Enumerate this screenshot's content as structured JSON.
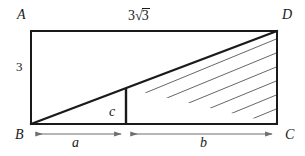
{
  "figure": {
    "type": "geometry-diagram",
    "vertices": {
      "A": "A",
      "B": "B",
      "C": "C",
      "D": "D"
    },
    "labels": {
      "top_side": {
        "coefficient": "3",
        "radical": "√",
        "radicand": "3",
        "full": "3√3"
      },
      "left_side": "3",
      "segment_a": "a",
      "segment_b": "b",
      "segment_c": "c"
    },
    "colors": {
      "stroke": "#1a1a1a",
      "hatch": "#555555",
      "dimension": "#6f6f6f",
      "background": "#ffffff"
    },
    "geometry": {
      "rect": {
        "x": 31,
        "y": 31,
        "width": 246,
        "height": 93
      },
      "diagonal": {
        "from": "B",
        "to": "D"
      },
      "split_x": 126,
      "hatch_spacing": 14,
      "dimension_line_y": 134
    }
  }
}
